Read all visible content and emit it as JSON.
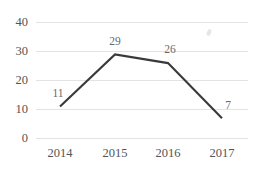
{
  "chart_data": {
    "type": "line",
    "title": "",
    "xlabel": "",
    "ylabel": "",
    "categories": [
      "2014",
      "2015",
      "2016",
      "2017"
    ],
    "values": [
      11,
      29,
      26,
      7
    ],
    "series": [
      {
        "name": "",
        "values": [
          11,
          29,
          26,
          7
        ]
      }
    ],
    "point_labels": [
      "11",
      "29",
      "26",
      "7"
    ],
    "ylim": [
      0,
      40
    ],
    "yticks": [
      0,
      10,
      20,
      30,
      40
    ],
    "ytick_labels": [
      "0",
      "10",
      "20",
      "30",
      "40"
    ],
    "xtick_labels": [
      "2014",
      "2015",
      "2016",
      "2017"
    ],
    "grid": true,
    "grid_axis": "y",
    "legend": false,
    "legend_position": "none",
    "colors": {
      "line": "#3a3a3a",
      "grid": "#e3e3e3",
      "tick_text": "#545454",
      "label_text": "#6a6a6a",
      "background": "#ffffff"
    }
  }
}
